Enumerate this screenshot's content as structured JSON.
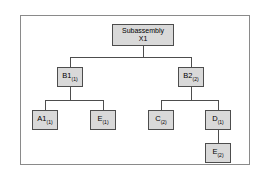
{
  "diagram": {
    "frame_border_color": "#8a8a8a",
    "node_fill_color": "#d9d9d9",
    "node_border_color": "#4d4d4d",
    "connector_color": "#4d4d4d",
    "background_color": "#ffffff"
  },
  "nodes": {
    "root": {
      "line1": "Subassembly",
      "line2": "X1",
      "name": "Subassembly X1"
    },
    "b1": {
      "base": "B1",
      "qty": "(1)"
    },
    "b2": {
      "base": "B2",
      "qty": "(2)"
    },
    "a1": {
      "base": "A1",
      "qty": "(1)"
    },
    "e1": {
      "base": "E",
      "qty": "(1)"
    },
    "c": {
      "base": "C",
      "qty": "(2)"
    },
    "d": {
      "base": "D",
      "qty": "(1)"
    },
    "e2": {
      "base": "E",
      "qty": "(2)"
    }
  }
}
